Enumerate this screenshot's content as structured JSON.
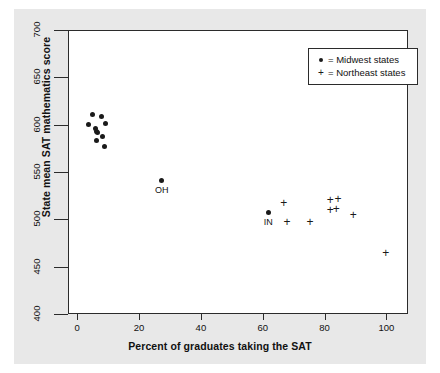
{
  "chart_data": {
    "type": "scatter",
    "title": "",
    "xlabel": "Percent of graduates taking the SAT",
    "ylabel": "State mean SAT mathematics score",
    "xlim": [
      -3,
      107
    ],
    "ylim": [
      400,
      700
    ],
    "xticks": [
      0,
      20,
      40,
      60,
      80,
      100
    ],
    "yticks": [
      400,
      450,
      500,
      550,
      600,
      650,
      700
    ],
    "grid": false,
    "legend_position": "top-right",
    "legend": [
      {
        "marker": "dot",
        "marker_glyph": "●",
        "equals": "=",
        "label": "Midwest states"
      },
      {
        "marker": "plus",
        "marker_glyph": "+",
        "equals": "=",
        "label": "Northeast states"
      }
    ],
    "series": [
      {
        "name": "Midwest states",
        "marker": "dot",
        "points": [
          {
            "x": 4.5,
            "y": 612,
            "label": ""
          },
          {
            "x": 3.2,
            "y": 601,
            "label": ""
          },
          {
            "x": 5.5,
            "y": 597,
            "label": ""
          },
          {
            "x": 5.8,
            "y": 594,
            "label": ""
          },
          {
            "x": 6.2,
            "y": 593,
            "label": ""
          },
          {
            "x": 7.5,
            "y": 610,
            "label": ""
          },
          {
            "x": 8.8,
            "y": 602,
            "label": ""
          },
          {
            "x": 7.8,
            "y": 589,
            "label": ""
          },
          {
            "x": 6.0,
            "y": 584,
            "label": ""
          },
          {
            "x": 8.5,
            "y": 578,
            "label": ""
          },
          {
            "x": 27.0,
            "y": 542,
            "label": "OH"
          },
          {
            "x": 61.5,
            "y": 508,
            "label": "IN"
          }
        ]
      },
      {
        "name": "Northeast states",
        "marker": "plus",
        "points": [
          {
            "x": 66.5,
            "y": 518,
            "label": ""
          },
          {
            "x": 67.5,
            "y": 498,
            "label": ""
          },
          {
            "x": 75.0,
            "y": 498,
            "label": ""
          },
          {
            "x": 81.5,
            "y": 521,
            "label": ""
          },
          {
            "x": 84.0,
            "y": 522,
            "label": ""
          },
          {
            "x": 81.5,
            "y": 510,
            "label": ""
          },
          {
            "x": 83.5,
            "y": 511,
            "label": ""
          },
          {
            "x": 89.0,
            "y": 505,
            "label": ""
          },
          {
            "x": 99.5,
            "y": 465,
            "label": ""
          }
        ]
      }
    ]
  }
}
